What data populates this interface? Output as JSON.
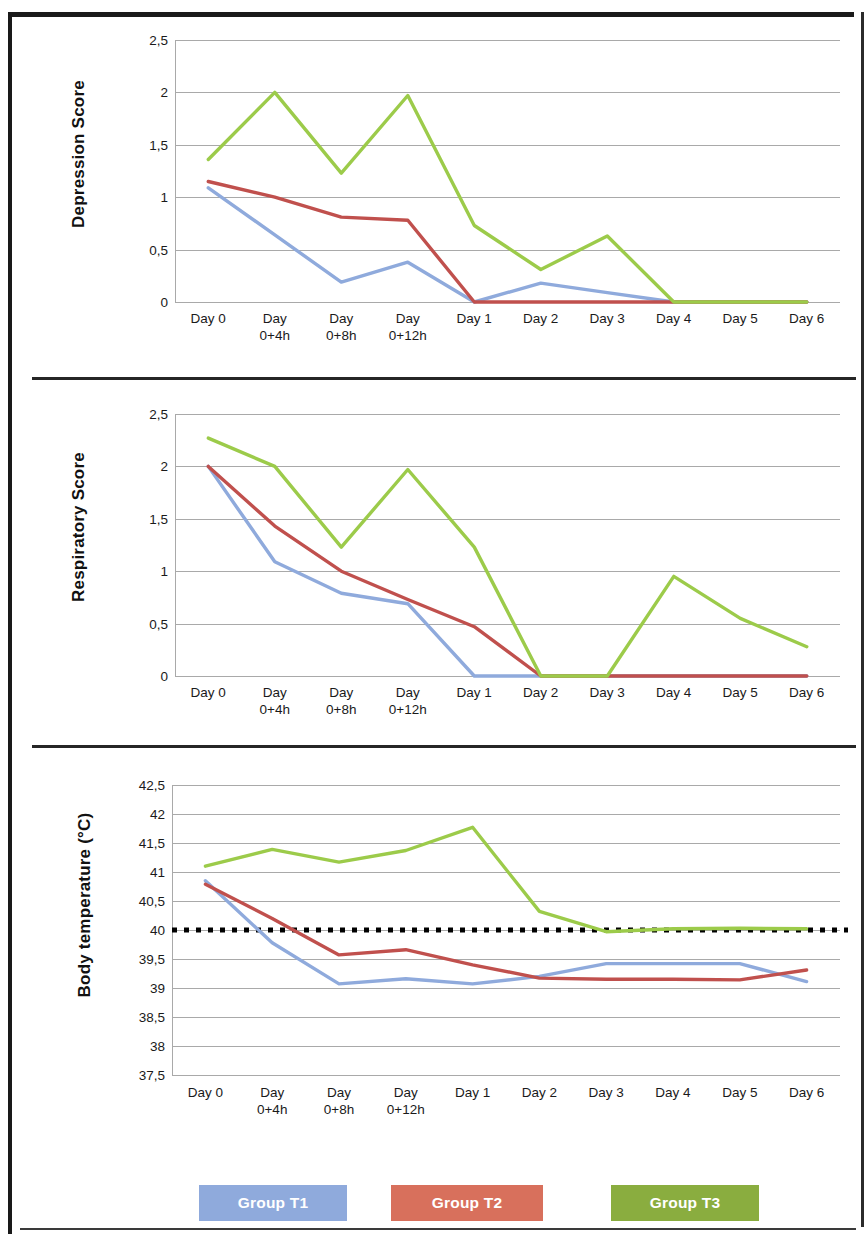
{
  "colors": {
    "group_t1": "#8faadc",
    "group_t2": "#c0504d",
    "group_t3": "#9ccb4a",
    "threshold_line": "#000000",
    "gridline": "#a9a9a9"
  },
  "legend": {
    "items": [
      {
        "label": "Group T1",
        "color": "#8faadc"
      },
      {
        "label": "Group T2",
        "color": "#d8705c"
      },
      {
        "label": "Group T3",
        "color": "#8aad3f"
      }
    ]
  },
  "chart_data": [
    {
      "type": "line",
      "title": "",
      "ylabel": "Depression Score",
      "xlabel": "",
      "categories": [
        "Day 0",
        "Day 0+4h",
        "Day 0+8h",
        "Day 0+12h",
        "Day 1",
        "Day 2",
        "Day 3",
        "Day 4",
        "Day 5",
        "Day 6"
      ],
      "xtick_lines": [
        [
          "Day 0",
          ""
        ],
        [
          "Day",
          "0+4h"
        ],
        [
          "Day",
          "0+8h"
        ],
        [
          "Day",
          "0+12h"
        ],
        [
          "Day 1",
          ""
        ],
        [
          "Day 2",
          ""
        ],
        [
          "Day 3",
          ""
        ],
        [
          "Day 4",
          ""
        ],
        [
          "Day 5",
          ""
        ],
        [
          "Day 6",
          ""
        ]
      ],
      "ylim": [
        0,
        2.5
      ],
      "yticks": [
        0,
        0.5,
        1,
        1.5,
        2,
        2.5
      ],
      "ytick_labels": [
        "0",
        "0,5",
        "1",
        "1,5",
        "2",
        "2,5"
      ],
      "grid": true,
      "legend_position": "bottom",
      "series": [
        {
          "name": "Group T1",
          "color": "#8faadc",
          "values": [
            1.09,
            0.64,
            0.19,
            0.38,
            0.0,
            0.18,
            0.09,
            0.0,
            0.0,
            0.0
          ]
        },
        {
          "name": "Group T2",
          "color": "#c0504d",
          "values": [
            1.15,
            1.0,
            0.81,
            0.78,
            0.0,
            0.0,
            0.0,
            0.0,
            0.0,
            0.0
          ]
        },
        {
          "name": "Group T3",
          "color": "#9ccb4a",
          "values": [
            1.36,
            2.0,
            1.23,
            1.97,
            0.73,
            0.31,
            0.63,
            0.0,
            0.0,
            0.0
          ]
        }
      ]
    },
    {
      "type": "line",
      "title": "",
      "ylabel": "Respiratory  Score",
      "xlabel": "",
      "categories": [
        "Day 0",
        "Day 0+4h",
        "Day 0+8h",
        "Day 0+12h",
        "Day 1",
        "Day 2",
        "Day 3",
        "Day 4",
        "Day 5",
        "Day 6"
      ],
      "xtick_lines": [
        [
          "Day 0",
          ""
        ],
        [
          "Day",
          "0+4h"
        ],
        [
          "Day",
          "0+8h"
        ],
        [
          "Day",
          "0+12h"
        ],
        [
          "Day 1",
          ""
        ],
        [
          "Day 2",
          ""
        ],
        [
          "Day 3",
          ""
        ],
        [
          "Day 4",
          ""
        ],
        [
          "Day 5",
          ""
        ],
        [
          "Day 6",
          ""
        ]
      ],
      "ylim": [
        0,
        2.5
      ],
      "yticks": [
        0,
        0.5,
        1,
        1.5,
        2,
        2.5
      ],
      "ytick_labels": [
        "0",
        "0,5",
        "1",
        "1,5",
        "2",
        "2,5"
      ],
      "grid": true,
      "legend_position": "bottom",
      "series": [
        {
          "name": "Group T1",
          "color": "#8faadc",
          "values": [
            2.0,
            1.09,
            0.79,
            0.69,
            0.0,
            0.0,
            0.0,
            0.0,
            0.0,
            0.0
          ]
        },
        {
          "name": "Group T2",
          "color": "#c0504d",
          "values": [
            2.0,
            1.43,
            1.0,
            0.73,
            0.47,
            0.0,
            0.0,
            0.0,
            0.0,
            0.0
          ]
        },
        {
          "name": "Group T3",
          "color": "#9ccb4a",
          "values": [
            2.27,
            2.0,
            1.23,
            1.97,
            1.23,
            0.0,
            0.0,
            0.95,
            0.55,
            0.28
          ]
        }
      ]
    },
    {
      "type": "line",
      "title": "",
      "ylabel": "Body temperature (°C)",
      "xlabel": "",
      "categories": [
        "Day 0",
        "Day 0+4h",
        "Day 0+8h",
        "Day 0+12h",
        "Day 1",
        "Day 2",
        "Day 3",
        "Day 4",
        "Day 5",
        "Day 6"
      ],
      "xtick_lines": [
        [
          "Day 0",
          ""
        ],
        [
          "Day",
          "0+4h"
        ],
        [
          "Day",
          "0+8h"
        ],
        [
          "Day",
          "0+12h"
        ],
        [
          "Day 1",
          ""
        ],
        [
          "Day 2",
          ""
        ],
        [
          "Day 3",
          ""
        ],
        [
          "Day 4",
          ""
        ],
        [
          "Day 5",
          ""
        ],
        [
          "Day 6",
          ""
        ]
      ],
      "ylim": [
        37.5,
        42.5
      ],
      "yticks": [
        37.5,
        38,
        38.5,
        39,
        39.5,
        40,
        40.5,
        41,
        41.5,
        42,
        42.5
      ],
      "ytick_labels": [
        "37,5",
        "38",
        "38,5",
        "39",
        "39,5",
        "40",
        "40,5",
        "41",
        "41,5",
        "42",
        "42,5"
      ],
      "grid": true,
      "legend_position": "bottom",
      "threshold": {
        "value": 40,
        "label": "",
        "style": "dotted",
        "color": "#000000"
      },
      "series": [
        {
          "name": "Group T1",
          "color": "#8faadc",
          "values": [
            40.85,
            39.78,
            39.07,
            39.16,
            39.07,
            39.2,
            39.42,
            39.42,
            39.42,
            39.11
          ]
        },
        {
          "name": "Group T2",
          "color": "#c0504d",
          "values": [
            40.79,
            40.2,
            39.57,
            39.66,
            39.4,
            39.17,
            39.15,
            39.15,
            39.14,
            39.31
          ]
        },
        {
          "name": "Group T3",
          "color": "#9ccb4a",
          "values": [
            41.1,
            41.39,
            41.17,
            41.37,
            41.77,
            40.32,
            39.97,
            40.02,
            40.03,
            40.02
          ]
        }
      ]
    }
  ]
}
